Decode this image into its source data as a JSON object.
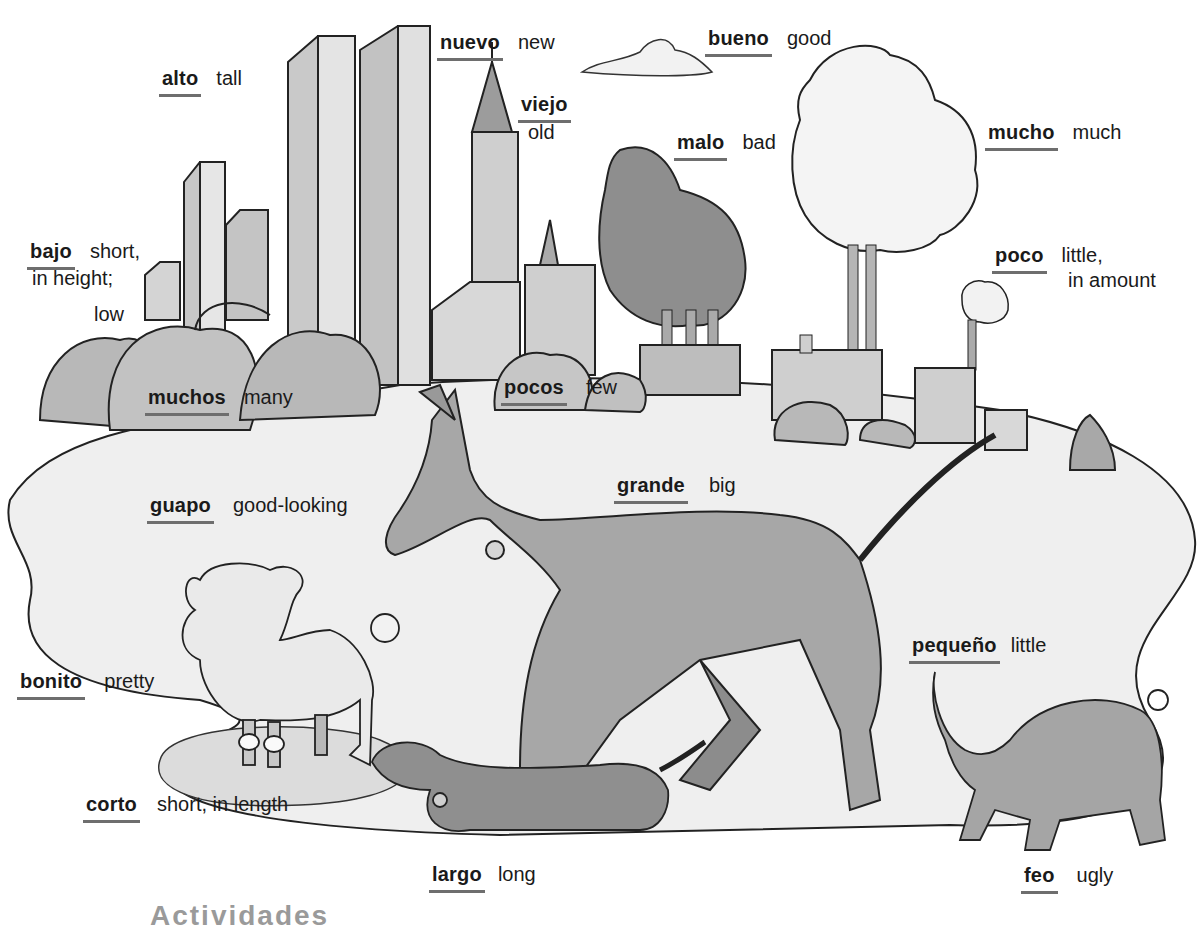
{
  "page": {
    "section_heading_partial": "Actividades"
  },
  "vocabulary": [
    {
      "id": "alto",
      "spanish": "alto",
      "english": "tall"
    },
    {
      "id": "nuevo",
      "spanish": "nuevo",
      "english": "new"
    },
    {
      "id": "viejo",
      "spanish": "viejo",
      "english": "old"
    },
    {
      "id": "bueno",
      "spanish": "bueno",
      "english": "good"
    },
    {
      "id": "malo",
      "spanish": "malo",
      "english": "bad"
    },
    {
      "id": "mucho",
      "spanish": "mucho",
      "english": "much"
    },
    {
      "id": "bajo",
      "spanish": "bajo",
      "english": "short,",
      "english_line2": "in height;",
      "english_line3": "low"
    },
    {
      "id": "poco",
      "spanish": "poco",
      "english": "little,",
      "english_line2": "in amount"
    },
    {
      "id": "muchos",
      "spanish": "muchos",
      "english": "many"
    },
    {
      "id": "pocos",
      "spanish": "pocos",
      "english": "few"
    },
    {
      "id": "grande",
      "spanish": "grande",
      "english": "big"
    },
    {
      "id": "guapo",
      "spanish": "guapo",
      "english": "good-looking"
    },
    {
      "id": "bonito",
      "spanish": "bonito",
      "english": "pretty"
    },
    {
      "id": "pequeno",
      "spanish": "pequeño",
      "english": "little"
    },
    {
      "id": "corto",
      "spanish": "corto",
      "english": "short, in length"
    },
    {
      "id": "largo",
      "spanish": "largo",
      "english": "long"
    },
    {
      "id": "feo",
      "spanish": "feo",
      "english": "ugly"
    }
  ],
  "illustration": {
    "elements": [
      "skyscrapers",
      "old-tower",
      "cloud",
      "dark-smoke-tree",
      "white-smoke-cloud",
      "factories",
      "bushes",
      "big-dog",
      "poodle",
      "dachshund",
      "bulldog",
      "grass-hill"
    ],
    "colors": {
      "ink": "#1a1a1a",
      "light_wash": "#d8d8d8",
      "mid_wash": "#b0b0b0",
      "dark_wash": "#8a8a8a",
      "underline": "#6e6e6e"
    }
  }
}
